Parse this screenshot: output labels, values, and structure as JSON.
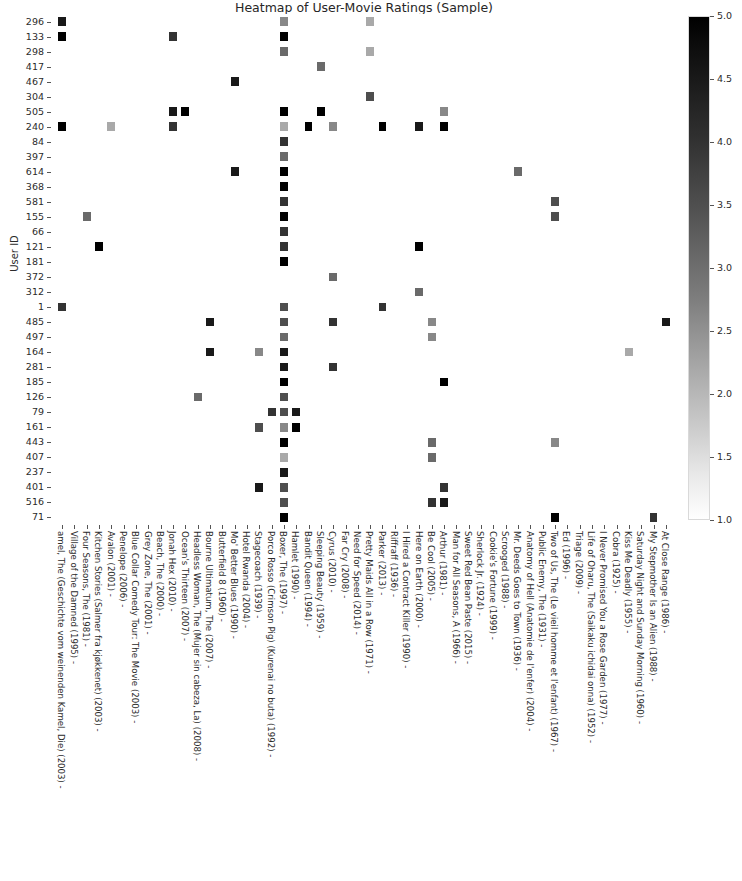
{
  "chart_data": {
    "type": "heatmap",
    "title": "Heatmap of User-Movie Ratings (Sample)",
    "xlabel": "",
    "ylabel": "User ID",
    "colormap": "Greys",
    "colorbar": {
      "ticks": [
        "5.0",
        "4.5",
        "4.0",
        "3.5",
        "3.0",
        "2.5",
        "2.0",
        "1.5",
        "1.0"
      ],
      "vmin": 1.0,
      "vmax": 5.0,
      "orientation": "vertical",
      "position": "right"
    },
    "grid": false,
    "yticklabels": [
      "296",
      "133",
      "298",
      "417",
      "467",
      "304",
      "505",
      "240",
      "84",
      "397",
      "614",
      "368",
      "581",
      "155",
      "66",
      "121",
      "181",
      "372",
      "312",
      "1",
      "485",
      "497",
      "164",
      "281",
      "185",
      "126",
      "79",
      "161",
      "443",
      "407",
      "237",
      "401",
      "516",
      "71"
    ],
    "xticklabels": [
      "amel, The (Geschichte vom weinenden Kamel, Die) (2003)",
      "Village of the Damned (1995)",
      "Four Seasons, The (1981)",
      "Kitchen Stories (Salmer fra kjøkkenet) (2003)",
      "Avalon (2001)",
      "Penelope (2006)",
      "Blue Collar Comedy Tour: The Movie (2003)",
      "Grey Zone, The (2001)",
      "Beach, The (2000)",
      "Jonah Hex (2010)",
      "Ocean's Thirteen (2007)",
      "Headless Woman, The (Mujer sin cabeza, La) (2008)",
      "Bourne Ultimatum, The (2007)",
      "Butterfield 8 (1960)",
      "Mo' Better Blues (1990)",
      "Hotel Rwanda (2004)",
      "Stagecoach (1939)",
      "Porco Rosso (Crimson Pig) (Kurenai no buta) (1992)",
      "Boxer, The (1997)",
      "Hamlet (1990)",
      "Bandit Queen (1994)",
      "Sleeping Beauty (1959)",
      "Cyrus (2010)",
      "Far Cry (2008)",
      "Need for Speed (2014)",
      "Pretty Maids All in a Row (1971)",
      "Parker (2013)",
      "Riffraff (1936)",
      "I Hired a Contract Killer (1990)",
      "Here on Earth (2000)",
      "Be Cool (2005)",
      "Arthur (1981)",
      "Man for All Seasons, A (1966)",
      "Sweet Red Bean Paste (2015)",
      "Sherlock Jr. (1924)",
      "Cookie's Fortune (1999)",
      "Scrooged (1988)",
      "Mr. Deeds Goes to Town (1936)",
      "Anatomy of Hell (Anatomie de l'enfer) (2004)",
      "Public Enemy, The (1931)",
      "Two of Us, The (Le vieil homme et l'enfant) (1967)",
      "Ed (1996)",
      "Triage (2009)",
      "Life of Oharu, The (Saikaku ichidai onna) (1952)",
      "I Never Promised You a Rose Garden (1977)",
      "Cobra (1925)",
      "Kiss Me Deadly (1955)",
      "Saturday Night and Sunday Morning (1960)",
      "My Stepmother Is an Alien (1988)",
      "At Close Range (1986)"
    ],
    "points": [
      {
        "r": 0,
        "c": 0,
        "v": 4.5
      },
      {
        "r": 0,
        "c": 25,
        "v": 2.0
      },
      {
        "r": 0,
        "c": 18,
        "v": 2.5
      },
      {
        "r": 1,
        "c": 0,
        "v": 5.0
      },
      {
        "r": 1,
        "c": 9,
        "v": 4.0
      },
      {
        "r": 1,
        "c": 18,
        "v": 5.0
      },
      {
        "r": 2,
        "c": 18,
        "v": 3.0
      },
      {
        "r": 2,
        "c": 25,
        "v": 2.0
      },
      {
        "r": 3,
        "c": 21,
        "v": 3.0
      },
      {
        "r": 4,
        "c": 14,
        "v": 4.5
      },
      {
        "r": 5,
        "c": 25,
        "v": 3.5
      },
      {
        "r": 6,
        "c": 9,
        "v": 4.5
      },
      {
        "r": 6,
        "c": 10,
        "v": 5.0
      },
      {
        "r": 6,
        "c": 18,
        "v": 5.0
      },
      {
        "r": 6,
        "c": 21,
        "v": 5.0
      },
      {
        "r": 6,
        "c": 31,
        "v": 2.5
      },
      {
        "r": 7,
        "c": 0,
        "v": 5.0
      },
      {
        "r": 7,
        "c": 4,
        "v": 2.0
      },
      {
        "r": 7,
        "c": 9,
        "v": 4.0
      },
      {
        "r": 7,
        "c": 18,
        "v": 2.0
      },
      {
        "r": 7,
        "c": 20,
        "v": 5.0
      },
      {
        "r": 7,
        "c": 22,
        "v": 2.5
      },
      {
        "r": 7,
        "c": 26,
        "v": 5.0
      },
      {
        "r": 7,
        "c": 29,
        "v": 4.5
      },
      {
        "r": 7,
        "c": 31,
        "v": 5.0
      },
      {
        "r": 8,
        "c": 18,
        "v": 4.0
      },
      {
        "r": 9,
        "c": 18,
        "v": 3.0
      },
      {
        "r": 10,
        "c": 14,
        "v": 4.5
      },
      {
        "r": 10,
        "c": 18,
        "v": 5.0
      },
      {
        "r": 10,
        "c": 37,
        "v": 3.0
      },
      {
        "r": 11,
        "c": 18,
        "v": 5.0
      },
      {
        "r": 12,
        "c": 18,
        "v": 4.0
      },
      {
        "r": 12,
        "c": 40,
        "v": 3.5
      },
      {
        "r": 13,
        "c": 2,
        "v": 3.0
      },
      {
        "r": 13,
        "c": 18,
        "v": 5.0
      },
      {
        "r": 13,
        "c": 40,
        "v": 3.5
      },
      {
        "r": 14,
        "c": 18,
        "v": 4.0
      },
      {
        "r": 15,
        "c": 3,
        "v": 5.0
      },
      {
        "r": 15,
        "c": 18,
        "v": 4.0
      },
      {
        "r": 15,
        "c": 29,
        "v": 5.0
      },
      {
        "r": 16,
        "c": 18,
        "v": 5.0
      },
      {
        "r": 17,
        "c": 22,
        "v": 3.0
      },
      {
        "r": 18,
        "c": 29,
        "v": 3.0
      },
      {
        "r": 19,
        "c": 0,
        "v": 4.0
      },
      {
        "r": 19,
        "c": 18,
        "v": 3.5
      },
      {
        "r": 19,
        "c": 26,
        "v": 4.0
      },
      {
        "r": 20,
        "c": 12,
        "v": 4.5
      },
      {
        "r": 20,
        "c": 18,
        "v": 3.5
      },
      {
        "r": 20,
        "c": 22,
        "v": 4.0
      },
      {
        "r": 20,
        "c": 30,
        "v": 2.5
      },
      {
        "r": 20,
        "c": 49,
        "v": 4.5
      },
      {
        "r": 21,
        "c": 18,
        "v": 3.0
      },
      {
        "r": 21,
        "c": 30,
        "v": 2.5
      },
      {
        "r": 22,
        "c": 12,
        "v": 4.5
      },
      {
        "r": 22,
        "c": 16,
        "v": 2.5
      },
      {
        "r": 22,
        "c": 18,
        "v": 4.5
      },
      {
        "r": 22,
        "c": 46,
        "v": 2.0
      },
      {
        "r": 23,
        "c": 18,
        "v": 4.5
      },
      {
        "r": 23,
        "c": 22,
        "v": 4.0
      },
      {
        "r": 24,
        "c": 18,
        "v": 5.0
      },
      {
        "r": 24,
        "c": 31,
        "v": 5.0
      },
      {
        "r": 25,
        "c": 18,
        "v": 3.5
      },
      {
        "r": 25,
        "c": 11,
        "v": 3.0
      },
      {
        "r": 26,
        "c": 17,
        "v": 4.0
      },
      {
        "r": 26,
        "c": 18,
        "v": 3.5
      },
      {
        "r": 26,
        "c": 19,
        "v": 4.5
      },
      {
        "r": 27,
        "c": 16,
        "v": 3.5
      },
      {
        "r": 27,
        "c": 18,
        "v": 2.5
      },
      {
        "r": 27,
        "c": 19,
        "v": 5.0
      },
      {
        "r": 28,
        "c": 18,
        "v": 5.0
      },
      {
        "r": 28,
        "c": 30,
        "v": 3.0
      },
      {
        "r": 28,
        "c": 40,
        "v": 2.5
      },
      {
        "r": 29,
        "c": 18,
        "v": 2.0
      },
      {
        "r": 29,
        "c": 30,
        "v": 3.0
      },
      {
        "r": 30,
        "c": 18,
        "v": 4.5
      },
      {
        "r": 31,
        "c": 16,
        "v": 4.5
      },
      {
        "r": 31,
        "c": 18,
        "v": 3.5
      },
      {
        "r": 31,
        "c": 31,
        "v": 4.0
      },
      {
        "r": 32,
        "c": 18,
        "v": 3.5
      },
      {
        "r": 32,
        "c": 30,
        "v": 4.0
      },
      {
        "r": 32,
        "c": 31,
        "v": 4.5
      },
      {
        "r": 33,
        "c": 18,
        "v": 5.0
      },
      {
        "r": 33,
        "c": 40,
        "v": 5.0
      },
      {
        "r": 33,
        "c": 48,
        "v": 4.0
      }
    ]
  }
}
